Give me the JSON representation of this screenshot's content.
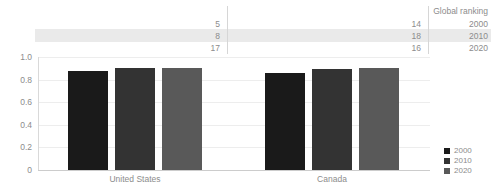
{
  "ranking_table": {
    "title": "Global ranking",
    "rows": [
      {
        "year": "2000",
        "united_states": "5",
        "canada": "14"
      },
      {
        "year": "2010",
        "united_states": "8",
        "canada": "18"
      },
      {
        "year": "2020",
        "united_states": "17",
        "canada": "16"
      }
    ],
    "highlight_row_index": 1,
    "highlight_color": "#eaeaea"
  },
  "chart_data": {
    "type": "bar",
    "title": "",
    "xlabel": "",
    "ylabel": "",
    "categories": [
      "United States",
      "Canada"
    ],
    "series": [
      {
        "name": "2000",
        "color": "#1a1a1a",
        "values": [
          0.875,
          0.86
        ]
      },
      {
        "name": "2010",
        "color": "#333333",
        "values": [
          0.9,
          0.89
        ]
      },
      {
        "name": "2020",
        "color": "#595959",
        "values": [
          0.9,
          0.905
        ]
      }
    ],
    "ylim": [
      0,
      1.0
    ],
    "yticks": [
      "1.0",
      "0.8",
      "0.6",
      "0.4",
      "0.2",
      "0"
    ],
    "ytick_values": [
      1.0,
      0.8,
      0.6,
      0.4,
      0.2,
      0
    ],
    "grid": true,
    "legend_position": "right-bottom"
  },
  "legend": {
    "items": [
      {
        "label": "2000",
        "color": "#1a1a1a"
      },
      {
        "label": "2010",
        "color": "#333333"
      },
      {
        "label": "2020",
        "color": "#595959"
      }
    ]
  }
}
